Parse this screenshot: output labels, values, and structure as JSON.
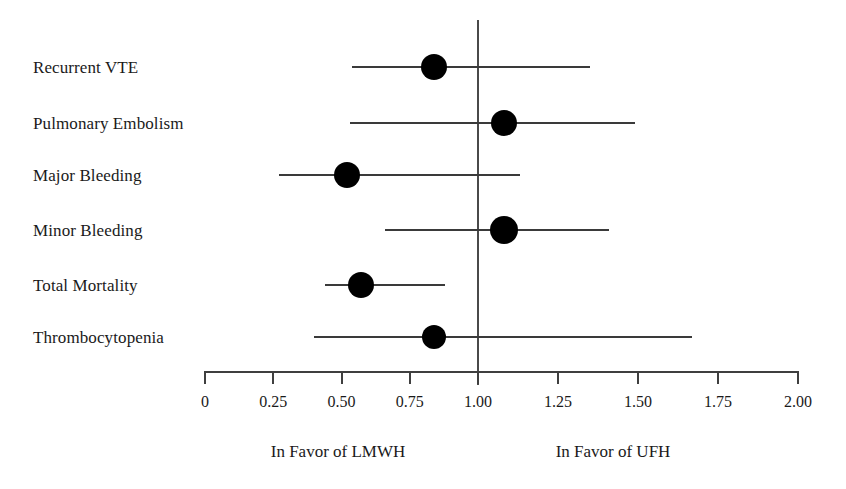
{
  "chart_data": {
    "type": "scatter",
    "title": "",
    "subtitle": "",
    "xlabel": "",
    "ylabel": "",
    "xlim": [
      0,
      2.0
    ],
    "grid": false,
    "legend": null,
    "reference_line": 1.0,
    "axis": {
      "ticks": [
        0,
        0.25,
        0.5,
        0.75,
        1.0,
        1.25,
        1.5,
        1.75,
        2.0
      ],
      "tick_labels": [
        "0",
        "0.25",
        "0.50",
        "0.75",
        "1.00",
        "1.25",
        "1.50",
        "1.75",
        "2.00"
      ]
    },
    "categories": [
      "Recurrent VTE",
      "Pulmonary Embolism",
      "Major Bleeding",
      "Minor Bleeding",
      "Total Mortality",
      "Thrombocytopenia"
    ],
    "values": [
      0.84,
      1.08,
      0.52,
      1.08,
      0.57,
      0.84
    ],
    "ci_low": [
      0.54,
      0.53,
      0.27,
      0.66,
      0.44,
      0.4
    ],
    "ci_high": [
      1.35,
      1.49,
      1.13,
      1.41,
      0.88,
      1.67
    ],
    "series": [
      {
        "name": "Odds Ratio (LMWH vs UFH)",
        "points": [
          {
            "category": "Recurrent VTE",
            "estimate": 0.84,
            "ci_low": 0.54,
            "ci_high": 1.35
          },
          {
            "category": "Pulmonary Embolism",
            "estimate": 1.08,
            "ci_low": 0.53,
            "ci_high": 1.49
          },
          {
            "category": "Major Bleeding",
            "estimate": 0.52,
            "ci_low": 0.27,
            "ci_high": 1.13
          },
          {
            "category": "Minor Bleeding",
            "estimate": 1.08,
            "ci_low": 0.66,
            "ci_high": 1.41
          },
          {
            "category": "Total Mortality",
            "estimate": 0.57,
            "ci_low": 0.44,
            "ci_high": 0.88
          },
          {
            "category": "Thrombocytopenia",
            "estimate": 0.84,
            "ci_low": 0.4,
            "ci_high": 1.67
          }
        ]
      }
    ],
    "annotations": {
      "left_favor": "In Favor of  LMWH",
      "right_favor": "In Favor of UFH"
    },
    "colors": {
      "marker": "#000000",
      "line": "#3a3a3a",
      "axis": "#3f3f3f",
      "text": "#1a1a1a",
      "background": "#ffffff"
    }
  }
}
